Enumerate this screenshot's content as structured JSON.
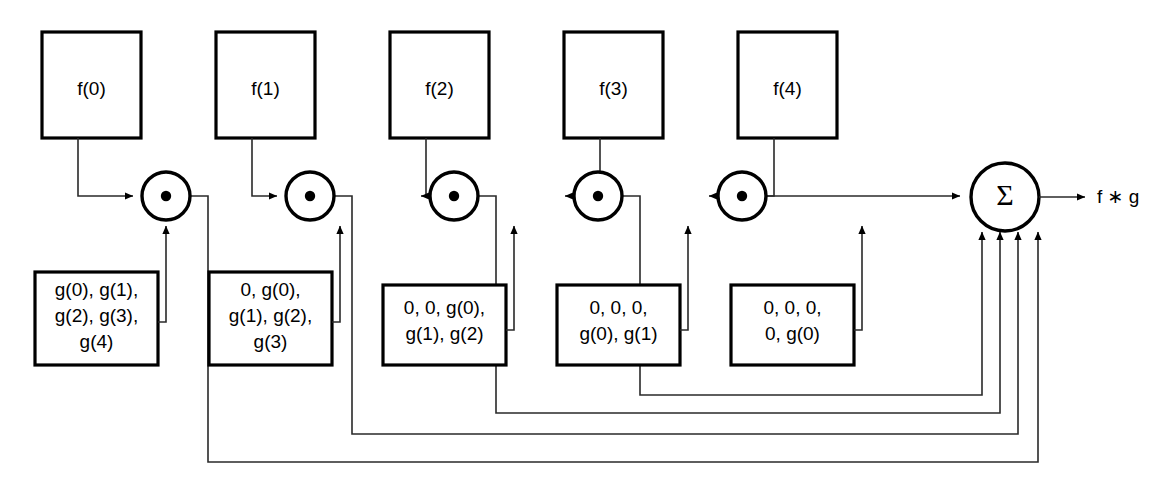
{
  "diagram": {
    "output_label": "f ∗ g",
    "sum_symbol": "Σ",
    "colors": {
      "stroke": "#000000",
      "fill": "#ffffff",
      "wire": "#1a1a1a"
    },
    "signal_boxes": [
      {
        "id": "f0",
        "label": "f(0)"
      },
      {
        "id": "f1",
        "label": "f(1)"
      },
      {
        "id": "f2",
        "label": "f(2)"
      },
      {
        "id": "f3",
        "label": "f(3)"
      },
      {
        "id": "f4",
        "label": "f(4)"
      }
    ],
    "multiplier_nodes": [
      {
        "id": "mul0",
        "symbol": "•"
      },
      {
        "id": "mul1",
        "symbol": "•"
      },
      {
        "id": "mul2",
        "symbol": "•"
      },
      {
        "id": "mul3",
        "symbol": "•"
      },
      {
        "id": "mul4",
        "symbol": "•"
      }
    ],
    "kernel_boxes": [
      {
        "id": "g0",
        "lines": [
          "g(0), g(1),",
          "g(2), g(3),",
          "g(4)"
        ]
      },
      {
        "id": "g1",
        "lines": [
          "0, g(0),",
          "g(1), g(2),",
          "g(3)"
        ]
      },
      {
        "id": "g2",
        "lines": [
          "0, 0, g(0),",
          "g(1), g(2)"
        ]
      },
      {
        "id": "g3",
        "lines": [
          "0, 0, 0,",
          "g(0), g(1)"
        ]
      },
      {
        "id": "g4",
        "lines": [
          "0, 0, 0,",
          "0, g(0)"
        ]
      }
    ]
  }
}
